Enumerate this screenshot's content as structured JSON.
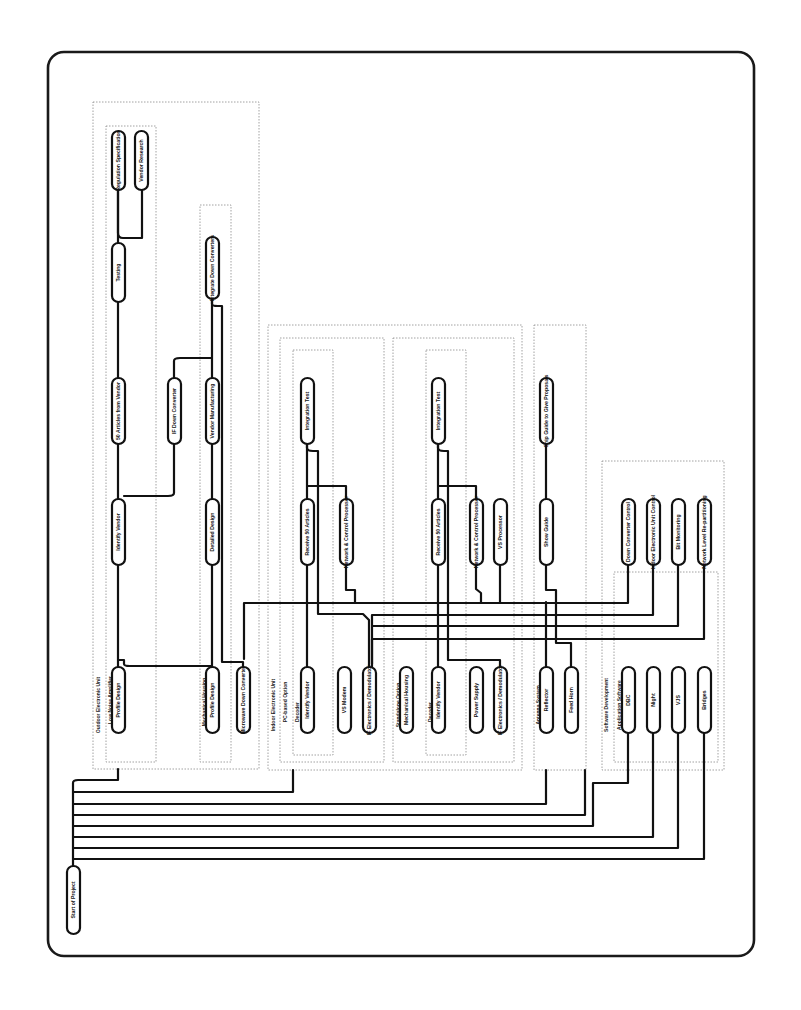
{
  "diagram": {
    "orientation": "rotated-90-ccw",
    "frame": {
      "x": 48,
      "y": 52,
      "w": 706,
      "h": 904,
      "r": 16
    },
    "colors": {
      "line": "#111111",
      "node_fill": "#ffffff",
      "group_border": "#8a8a8a",
      "background": "#ffffff"
    },
    "groups": [
      {
        "id": "g-outdoor",
        "label": "Outdoor Electronic Unit",
        "x": 93,
        "y": 102,
        "w": 166,
        "h": 667,
        "label_x": 96,
        "label_y": 705
      },
      {
        "id": "g-lna",
        "label": "Low Noise Amplifier",
        "x": 106,
        "y": 126,
        "w": 50,
        "h": 636,
        "label_x": 108,
        "label_y": 700
      },
      {
        "id": "g-mech",
        "label": "Mechanical Housing",
        "x": 200,
        "y": 205,
        "w": 31,
        "h": 557,
        "label_x": 202,
        "label_y": 702
      },
      {
        "id": "g-indoor",
        "label": "Indoor Electronic Unit",
        "x": 268,
        "y": 325,
        "w": 254,
        "h": 445,
        "label_x": 271,
        "label_y": 705
      },
      {
        "id": "g-pc",
        "label": "PC-based Option",
        "x": 280,
        "y": 338,
        "w": 104,
        "h": 424,
        "label_x": 283,
        "label_y": 702
      },
      {
        "id": "g-dec1",
        "label": "Decoder",
        "x": 293,
        "y": 350,
        "w": 40,
        "h": 405,
        "label_x": 295,
        "label_y": 712
      },
      {
        "id": "g-stand",
        "label": "Standalone Option",
        "x": 393,
        "y": 338,
        "w": 121,
        "h": 424,
        "label_x": 396,
        "label_y": 705
      },
      {
        "id": "g-dec2",
        "label": "Decoder",
        "x": 426,
        "y": 350,
        "w": 40,
        "h": 405,
        "label_x": 428,
        "label_y": 712
      },
      {
        "id": "g-antenna",
        "label": "Antenna System",
        "x": 534,
        "y": 325,
        "w": 52,
        "h": 445,
        "label_x": 536,
        "label_y": 705
      },
      {
        "id": "g-software",
        "label": "Software Development",
        "x": 602,
        "y": 461,
        "w": 122,
        "h": 309,
        "label_x": 604,
        "label_y": 705
      },
      {
        "id": "g-appsw",
        "label": "Application Software",
        "x": 614,
        "y": 572,
        "w": 104,
        "h": 190,
        "label_x": 617,
        "label_y": 705
      }
    ],
    "nodes": [
      {
        "id": "n-reg-spec",
        "label": "Regulation Specification",
        "x": 112,
        "y": 131,
        "w": 13,
        "h": 59
      },
      {
        "id": "n-vendor-research",
        "label": "Vendor Research",
        "x": 135,
        "y": 131,
        "w": 13,
        "h": 59
      },
      {
        "id": "n-testing",
        "label": "Testing",
        "x": 112,
        "y": 243,
        "w": 13,
        "h": 59
      },
      {
        "id": "n-lna-vendor",
        "label": "50 Articles from Vendor",
        "x": 112,
        "y": 378,
        "w": 13,
        "h": 66
      },
      {
        "id": "n-identify-vendor-1",
        "label": "Identify Vendor",
        "x": 112,
        "y": 499,
        "w": 13,
        "h": 66
      },
      {
        "id": "n-profile-design-1",
        "label": "Profile Design",
        "x": 112,
        "y": 667,
        "w": 13,
        "h": 66
      },
      {
        "id": "n-integrate-down",
        "label": "Integrate Down Converters",
        "x": 206,
        "y": 237,
        "w": 13,
        "h": 62
      },
      {
        "id": "n-rf-down",
        "label": "IF Down Converter",
        "x": 168,
        "y": 378,
        "w": 13,
        "h": 66
      },
      {
        "id": "n-vendor-mfg",
        "label": "Vendor Manufacturing",
        "x": 206,
        "y": 378,
        "w": 13,
        "h": 66
      },
      {
        "id": "n-detailed-design",
        "label": "Detailed Design",
        "x": 206,
        "y": 499,
        "w": 13,
        "h": 66
      },
      {
        "id": "n-profile-design-2",
        "label": "Profile Design",
        "x": 206,
        "y": 667,
        "w": 13,
        "h": 66
      },
      {
        "id": "n-microwave-down",
        "label": "Microwave Down Converter",
        "x": 237,
        "y": 667,
        "w": 13,
        "h": 66
      },
      {
        "id": "n-integration-test-1",
        "label": "Integration Test",
        "x": 301,
        "y": 378,
        "w": 13,
        "h": 66
      },
      {
        "id": "n-receive-50-1",
        "label": "Receive 50 Articles",
        "x": 301,
        "y": 499,
        "w": 13,
        "h": 66
      },
      {
        "id": "n-network-ctrl-1",
        "label": "Network & Control Processor",
        "x": 340,
        "y": 499,
        "w": 13,
        "h": 66
      },
      {
        "id": "n-identify-vendor-2",
        "label": "Identify Vendor",
        "x": 301,
        "y": 667,
        "w": 13,
        "h": 66
      },
      {
        "id": "n-vo-modem",
        "label": "VS Modem",
        "x": 338,
        "y": 667,
        "w": 13,
        "h": 66
      },
      {
        "id": "n-mod-1",
        "label": "IF Electronics / Demodulator",
        "x": 363,
        "y": 667,
        "w": 13,
        "h": 66
      },
      {
        "id": "n-integration-test-2",
        "label": "Integration Test",
        "x": 432,
        "y": 378,
        "w": 13,
        "h": 66
      },
      {
        "id": "n-receive-50-2",
        "label": "Receive 50 Articles",
        "x": 432,
        "y": 499,
        "w": 13,
        "h": 66
      },
      {
        "id": "n-network-ctrl-2",
        "label": "Network & Control Processor",
        "x": 470,
        "y": 499,
        "w": 13,
        "h": 66
      },
      {
        "id": "n-vs-processor",
        "label": "VS Processor",
        "x": 494,
        "y": 499,
        "w": 13,
        "h": 66
      },
      {
        "id": "n-mech-housing",
        "label": "Mechanical Housing",
        "x": 400,
        "y": 667,
        "w": 13,
        "h": 66
      },
      {
        "id": "n-identify-vendor-3",
        "label": "Identify Vendor",
        "x": 432,
        "y": 667,
        "w": 13,
        "h": 66
      },
      {
        "id": "n-power-supply",
        "label": "Power Supply",
        "x": 470,
        "y": 667,
        "w": 13,
        "h": 66
      },
      {
        "id": "n-mod-2",
        "label": "IF Electronics / Demodulator",
        "x": 494,
        "y": 667,
        "w": 13,
        "h": 66
      },
      {
        "id": "n-ship-guide",
        "label": "Ship Guide to Give Proposals",
        "x": 540,
        "y": 378,
        "w": 13,
        "h": 66
      },
      {
        "id": "n-ship-guide-2",
        "label": "Show Guide",
        "x": 540,
        "y": 499,
        "w": 13,
        "h": 66
      },
      {
        "id": "n-reflector",
        "label": "Reflector",
        "x": 540,
        "y": 667,
        "w": 13,
        "h": 66
      },
      {
        "id": "n-feed-horn",
        "label": "Feed Horn",
        "x": 565,
        "y": 667,
        "w": 13,
        "h": 66
      },
      {
        "id": "n-down-ctrl",
        "label": "Down Converter Control",
        "x": 622,
        "y": 499,
        "w": 13,
        "h": 66
      },
      {
        "id": "n-indoor-ctrl",
        "label": "Indoor Electronic Unit Control",
        "x": 647,
        "y": 499,
        "w": 13,
        "h": 66
      },
      {
        "id": "n-bit-monitoring",
        "label": "Bit Monitoring",
        "x": 672,
        "y": 499,
        "w": 13,
        "h": 66
      },
      {
        "id": "n-network-level",
        "label": "Network Level Re-partitioning",
        "x": 698,
        "y": 499,
        "w": 13,
        "h": 66
      },
      {
        "id": "n-dbc",
        "label": "DBC",
        "x": 622,
        "y": 667,
        "w": 13,
        "h": 66
      },
      {
        "id": "n-night",
        "label": "Night",
        "x": 647,
        "y": 667,
        "w": 13,
        "h": 66
      },
      {
        "id": "n-vjs",
        "label": "VJS",
        "x": 672,
        "y": 667,
        "w": 13,
        "h": 66
      },
      {
        "id": "n-bridges",
        "label": "Bridges",
        "x": 698,
        "y": 667,
        "w": 13,
        "h": 66
      },
      {
        "id": "n-start",
        "label": "Start of Project",
        "x": 67,
        "y": 866,
        "w": 13,
        "h": 68
      }
    ],
    "edges": [
      "M118 190 L118 233 Q118 238 123 238 L142 238 L142 190",
      "M118 243 L118 190",
      "M118 302 L118 378",
      "M118 444 L118 499",
      "M118 565 L118 667",
      "M118 660 L124 660 L124 664 Q124 666 130 666 L212 666",
      "M174 444 L174 493 Q174 496 168 496 L124 496",
      "M174 378 L174 361 Q174 358 180 358 L212 358",
      "M212 299 L212 378",
      "M212 444 L212 499",
      "M212 565 L212 667",
      "M212 299 L212 304 Q212 306 218 306 L222 306 L222 662 L243 662 L243 667",
      "M307 444 L307 499",
      "M307 565 L307 667",
      "M307 444 L307 448 Q307 451 313 451 L318 451 L318 614 L363 614 L369 620 L369 667",
      "M307 486 L346 486 L346 499",
      "M346 565 L346 590 L355 590 L355 602",
      "M438 444 L438 499",
      "M438 565 L438 667",
      "M438 444 L438 448 Q438 451 444 451 L448 451 L448 660 L500 660 L500 667",
      "M438 486 L476 486 L476 499",
      "M476 565 L476 589 L481 593 L481 602",
      "M500 565 L500 602",
      "M546 444 L546 499",
      "M546 565 L546 590 L556 590 L556 602",
      "M546 602 L546 667",
      "M556 602 L556 643 L571 643 L571 667",
      "M628 565 L628 603 L244 603 L244 659",
      "M653 565 L653 615 L372 615 L372 667",
      "M678 565 L678 626 L372 626",
      "M704 565 L704 639 L372 639 L372 664",
      "M73 866 L73 864 L73 783 Q73 780 78 780 L118 780 L118 769",
      "M73 792 L293 792 L293 770",
      "M73 804 L546 804 L546 770",
      "M73 815 L585 815 L585 770",
      "M73 826 L593 826 L593 783 L628 783 L628 733",
      "M73 837 L653 837 L653 733",
      "M73 848 L678 848 L678 733",
      "M73 859 L704 859 L704 733"
    ]
  }
}
